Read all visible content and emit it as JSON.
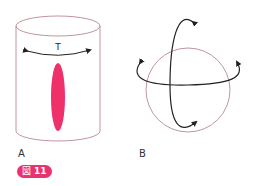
{
  "figure": {
    "badge_prefix": "図",
    "badge_number": "11",
    "badge_color": "#e8336f"
  },
  "panels": [
    {
      "label": "A",
      "arrow_label": "T",
      "subject": "cylinder-with-elongated-lesion"
    },
    {
      "label": "B",
      "subject": "sphere-with-rotation-arrows"
    }
  ],
  "colors": {
    "outline": "#b07a84",
    "lesion": "#f0306a",
    "arrow": "#222222"
  }
}
